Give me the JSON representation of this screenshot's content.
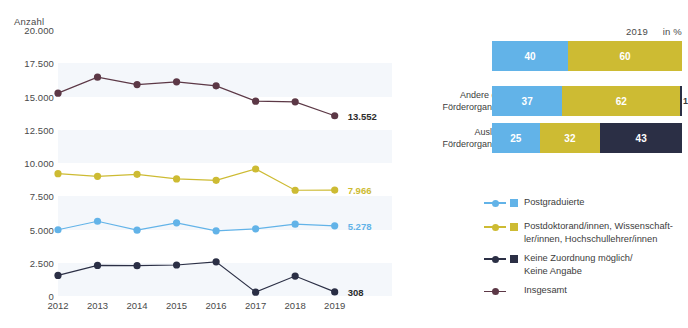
{
  "colors": {
    "postgraduierte": "#62b3e8",
    "postdoc": "#cdbb33",
    "keine_zuordnung": "#2b2f45",
    "insgesamt": "#5c3846",
    "band": "#eef2f8",
    "text": "#3c3c3c"
  },
  "line_chart": {
    "y_axis_title": "Anzahl",
    "y_ticks": [
      "20.000",
      "17.500",
      "15.000",
      "12.500",
      "10.000",
      "7.500",
      "5.000",
      "2.500",
      "0"
    ],
    "x_ticks": [
      "2012",
      "2013",
      "2014",
      "2015",
      "2016",
      "2017",
      "2018",
      "2019"
    ],
    "end_labels": {
      "insgesamt": "13.552",
      "postdoc": "7.966",
      "postgraduierte": "5.278",
      "keine_zuordnung": "308"
    }
  },
  "bar_chart": {
    "header_year": "2019",
    "header_unit": "in %",
    "rows": [
      {
        "label": "DAAD",
        "segments": [
          {
            "name": "postgraduierte",
            "value": "40"
          },
          {
            "name": "postdoc",
            "value": "60"
          }
        ]
      },
      {
        "label": "Andere deutsche\nFörderorganisationen",
        "segments": [
          {
            "name": "postgraduierte",
            "value": "37"
          },
          {
            "name": "postdoc",
            "value": "62"
          },
          {
            "name": "keine_zuordnung",
            "value": "1"
          }
        ]
      },
      {
        "label": "Ausländische\nFörderorganisationen",
        "segments": [
          {
            "name": "postgraduierte",
            "value": "25"
          },
          {
            "name": "postdoc",
            "value": "32"
          },
          {
            "name": "keine_zuordnung",
            "value": "43"
          }
        ]
      }
    ]
  },
  "legend": [
    {
      "label": "Postgraduierte",
      "color": "#62b3e8",
      "swatch": true
    },
    {
      "label": "Postdoktorand/innen, Wissenschaft-\nler/innen, Hochschullehrer/innen",
      "color": "#cdbb33",
      "swatch": true
    },
    {
      "label": "Keine Zuordnung möglich/\nKeine Angabe",
      "color": "#2b2f45",
      "swatch": true
    },
    {
      "label": "Insgesamt",
      "color": "#5c3846",
      "swatch": false
    }
  ],
  "chart_data": [
    {
      "type": "line",
      "title": "",
      "xlabel": "",
      "ylabel": "Anzahl",
      "ylim": [
        0,
        20000
      ],
      "grid": false,
      "x": [
        "2012",
        "2013",
        "2014",
        "2015",
        "2016",
        "2017",
        "2018",
        "2019"
      ],
      "series": [
        {
          "name": "Insgesamt",
          "color": "#5c3846",
          "values": [
            15250,
            16450,
            15900,
            16100,
            15800,
            14650,
            14600,
            13552
          ],
          "end_label": "13.552"
        },
        {
          "name": "Postdoktorand/innen, Wissenschaftler/innen, Hochschullehrer/innen",
          "color": "#cdbb33",
          "values": [
            9200,
            9000,
            9150,
            8800,
            8700,
            9550,
            7950,
            7966
          ],
          "end_label": "7.966"
        },
        {
          "name": "Postgraduierte",
          "color": "#62b3e8",
          "values": [
            4980,
            5620,
            4950,
            5500,
            4900,
            5050,
            5400,
            5278
          ],
          "end_label": "5.278"
        },
        {
          "name": "Keine Zuordnung möglich/Keine Angabe",
          "color": "#2b2f45",
          "values": [
            1550,
            2300,
            2280,
            2330,
            2570,
            290,
            1500,
            308
          ],
          "end_label": "308"
        }
      ]
    },
    {
      "type": "bar",
      "orientation": "horizontal",
      "stacked": true,
      "unit": "in %",
      "year": "2019",
      "categories": [
        "DAAD",
        "Andere deutsche Förderorganisationen",
        "Ausländische Förderorganisationen"
      ],
      "series": [
        {
          "name": "Postgraduierte",
          "color": "#62b3e8",
          "values": [
            40,
            37,
            25
          ]
        },
        {
          "name": "Postdoktorand/innen, Wissenschaftler/innen, Hochschullehrer/innen",
          "color": "#cdbb33",
          "values": [
            60,
            62,
            32
          ]
        },
        {
          "name": "Keine Zuordnung möglich/Keine Angabe",
          "color": "#2b2f45",
          "values": [
            0,
            1,
            43
          ]
        }
      ],
      "xlim": [
        0,
        100
      ]
    }
  ]
}
